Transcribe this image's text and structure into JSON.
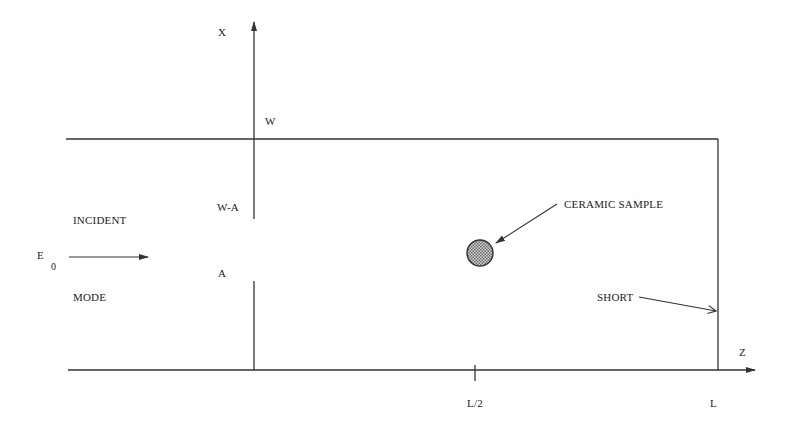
{
  "diagram": {
    "type": "waveguide-cavity-schematic",
    "colors": {
      "line": "#333333",
      "text": "#222222",
      "sample_fill": "#9a9a9a",
      "background": "#ffffff"
    },
    "axes": {
      "x_axis_label": "X",
      "z_axis_label": "Z"
    },
    "x_axis_marks": {
      "w": "W",
      "w_minus_a": "W-A",
      "a": "A"
    },
    "z_axis_marks": {
      "half_length": "L/2",
      "length": "L"
    },
    "source": {
      "field_symbol": "E",
      "field_subscript": "0",
      "label_top": "INCIDENT",
      "label_bottom": "MODE"
    },
    "callouts": {
      "sample": "CERAMIC SAMPLE",
      "short": "SHORT"
    }
  }
}
